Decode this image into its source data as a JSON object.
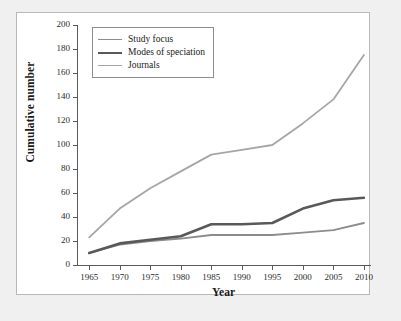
{
  "chart_data": {
    "type": "line",
    "title": "",
    "xlabel": "Year",
    "ylabel": "Cumulative number",
    "x": [
      1965,
      1970,
      1975,
      1980,
      1985,
      1990,
      1995,
      2000,
      2005,
      2010
    ],
    "xlim": [
      1963,
      2011
    ],
    "ylim": [
      0,
      200
    ],
    "ytick_step": 20,
    "grid": false,
    "legend_position": "top-left inside plot",
    "series": [
      {
        "name": "Study focus",
        "color": "#8c8c8c",
        "width": 1.8,
        "values": [
          10,
          17,
          20,
          22,
          25,
          25,
          25,
          27,
          29,
          35
        ]
      },
      {
        "name": "Modes of speciation",
        "color": "#595959",
        "width": 2.6,
        "values": [
          10,
          18,
          21,
          24,
          34,
          34,
          35,
          47,
          54,
          56
        ]
      },
      {
        "name": "Journals",
        "color": "#a6a6a6",
        "width": 1.8,
        "values": [
          23,
          47,
          64,
          78,
          92,
          96,
          100,
          118,
          138,
          175
        ]
      }
    ],
    "xtick_labels": [
      "1965",
      "1970",
      "1975",
      "1980",
      "1985",
      "1990",
      "1995",
      "2000",
      "2005",
      "2010"
    ],
    "ytick_labels": [
      "0",
      "20",
      "40",
      "60",
      "80",
      "100",
      "120",
      "140",
      "160",
      "180",
      "200"
    ]
  },
  "legend": {
    "entries": [
      {
        "label": "Study focus"
      },
      {
        "label": "Modes of speciation"
      },
      {
        "label": "Journals"
      }
    ]
  }
}
